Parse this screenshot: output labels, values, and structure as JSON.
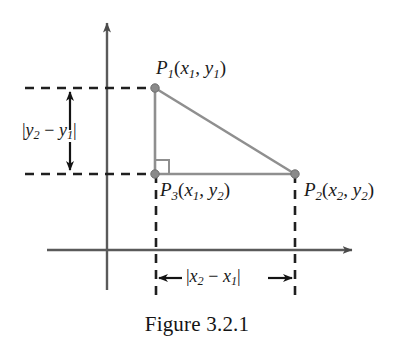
{
  "figure": {
    "caption": "Figure 3.2.1",
    "background_color": "#ffffff",
    "axis_color": "#5a5a5a",
    "triangle_color": "#8a8a8a",
    "dash_color": "#1f1f1f",
    "text_color": "#1a1a1a"
  },
  "axes": {
    "x_axis_name": "x-axis",
    "y_axis_name": "y-axis",
    "origin_x": 107,
    "origin_y": 250,
    "x_axis_start": 47,
    "x_axis_end": 357,
    "y_axis_top": 18,
    "y_axis_bottom": 290,
    "arrowheads": "both-positive-directions"
  },
  "points": [
    {
      "id": "P1",
      "name": "point-p1",
      "label_parts": {
        "p": "P",
        "index": "1",
        "open": "(",
        "x": "x",
        "xsub": "1",
        "comma": ", ",
        "y": "y",
        "ysub": "1",
        "close": ")"
      },
      "label_text": "P1(x1, y1)",
      "cx": 155,
      "cy": 88
    },
    {
      "id": "P2",
      "name": "point-p2",
      "label_parts": {
        "p": "P",
        "index": "2",
        "open": "(",
        "x": "x",
        "xsub": "2",
        "comma": ", ",
        "y": "y",
        "ysub": "2",
        "close": ")"
      },
      "label_text": "P2(x2, y2)",
      "cx": 295,
      "cy": 174
    },
    {
      "id": "P3",
      "name": "point-p3",
      "label_parts": {
        "p": "P",
        "index": "3",
        "open": "(",
        "x": "x",
        "xsub": "1",
        "comma": ", ",
        "y": "y",
        "ysub": "2",
        "close": ")"
      },
      "label_text": "P3(x1, y2)",
      "cx": 155,
      "cy": 174
    }
  ],
  "measures": {
    "vertical": {
      "name": "vertical-distance-label",
      "text": "|y2 - y1|",
      "parts": {
        "bar_open": "|",
        "y_a": "y",
        "sub_a": "2",
        "minus": " − ",
        "y_b": "y",
        "sub_b": "1",
        "bar_close": "|"
      },
      "arrow_x": 70,
      "arrow_top": 90,
      "arrow_bottom": 172
    },
    "horizontal": {
      "name": "horizontal-distance-label",
      "text": "|x2 - x1|",
      "parts": {
        "bar_open": "|",
        "x_a": "x",
        "sub_a": "2",
        "minus": " − ",
        "x_b": "x",
        "sub_b": "1",
        "bar_close": "|"
      },
      "arrow_y": 278,
      "arrow_left": 157,
      "arrow_right": 294
    }
  },
  "guides": {
    "upper_horizontal_dashed": {
      "name": "dashed-guide-upper-horizontal",
      "x1": 25,
      "y1": 88,
      "x2": 155,
      "y2": 88
    },
    "lower_horizontal_dashed": {
      "name": "dashed-guide-lower-horizontal",
      "x1": 25,
      "y1": 174,
      "x2": 156,
      "y2": 174
    },
    "left_vertical_dashed": {
      "name": "dashed-guide-left-vertical",
      "x1": 156,
      "y1": 174,
      "x2": 156,
      "y2": 302
    },
    "right_vertical_dashed": {
      "name": "dashed-guide-right-vertical",
      "x1": 295,
      "y1": 174,
      "x2": 295,
      "y2": 302
    }
  },
  "triangle": {
    "name": "right-triangle",
    "vertices": [
      [
        155,
        88
      ],
      [
        155,
        174
      ],
      [
        295,
        174
      ]
    ],
    "right_angle_marker": {
      "name": "right-angle-marker",
      "size": 14,
      "at": [
        155,
        174
      ]
    }
  }
}
